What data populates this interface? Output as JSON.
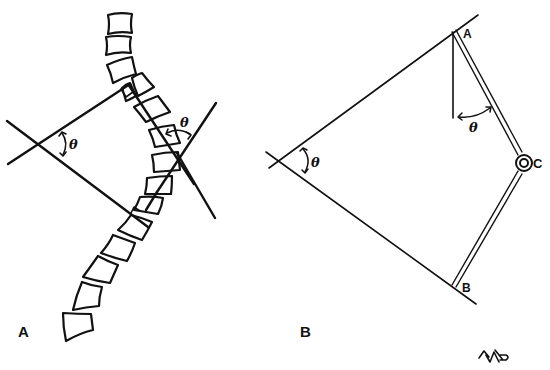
{
  "figure": {
    "panel_a": {
      "label": "A",
      "angle_labels": [
        "θ",
        "θ"
      ],
      "description": "Scoliotic spine with Cobb angle construction"
    },
    "panel_b": {
      "label": "B",
      "point_labels": {
        "a": "A",
        "b": "B",
        "c": "C"
      },
      "angle_labels": [
        "θ",
        "θ"
      ],
      "description": "Goniometer geometry with hinge at C"
    },
    "signature": "AMP"
  }
}
